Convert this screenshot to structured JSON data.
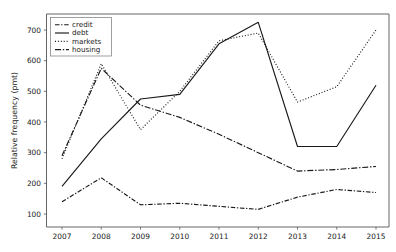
{
  "chart_data": {
    "type": "line",
    "title": "",
    "xlabel": "",
    "ylabel": "Relative frequency (pmt)",
    "categories": [
      "2007",
      "2008",
      "2009",
      "2010",
      "2011",
      "2012",
      "2013",
      "2014",
      "2015"
    ],
    "x": [
      2007,
      2008,
      2009,
      2010,
      2011,
      2012,
      2013,
      2014,
      2015
    ],
    "xlim": [
      2006.6,
      2015.4
    ],
    "ylim": [
      85,
      745
    ],
    "yticks": [
      100,
      200,
      300,
      400,
      500,
      600,
      700
    ],
    "ytick_labels": [
      "100",
      "200",
      "300",
      "400",
      "500",
      "600",
      "700"
    ],
    "grid": false,
    "legend_position": "top-left",
    "series": [
      {
        "name": "credit",
        "style": "dash-dot",
        "color": "#1a1a1a",
        "values": [
          140,
          218,
          130,
          135,
          125,
          115,
          155,
          180,
          170
        ]
      },
      {
        "name": "debt",
        "style": "solid",
        "color": "#1a1a1a",
        "values": [
          190,
          345,
          475,
          490,
          655,
          725,
          320,
          320,
          520
        ]
      },
      {
        "name": "markets",
        "style": "dotted",
        "color": "#1a1a1a",
        "values": [
          280,
          590,
          375,
          500,
          665,
          690,
          465,
          515,
          700
        ]
      },
      {
        "name": "housing",
        "style": "long-dash-dot",
        "color": "#1a1a1a",
        "values": [
          290,
          575,
          455,
          415,
          360,
          300,
          240,
          245,
          255
        ]
      }
    ]
  },
  "legend": {
    "entries": [
      {
        "label": "credit"
      },
      {
        "label": "debt"
      },
      {
        "label": "markets"
      },
      {
        "label": "housing"
      }
    ]
  },
  "axes": {
    "y_title": "Relative frequency (pmt)",
    "y_tick_labels": [
      "700",
      "600",
      "500",
      "400",
      "300",
      "200",
      "100"
    ],
    "x_tick_labels": [
      "2007",
      "2008",
      "2009",
      "2010",
      "2011",
      "2012",
      "2013",
      "2014",
      "2015"
    ]
  }
}
